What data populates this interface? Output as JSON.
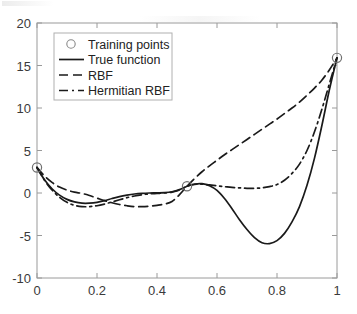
{
  "figure": {
    "background_color": "#ffffff",
    "axis_color": "#9a9a9a",
    "line_color": "#1a1a1a",
    "legend_border_color": "#b0b0b0",
    "legend_position": "upper-left"
  },
  "chart_data": {
    "type": "line",
    "title": "",
    "xlabel": "",
    "ylabel": "",
    "xlim": [
      0,
      1
    ],
    "ylim": [
      -10,
      20
    ],
    "grid": false,
    "xticks": [
      "0",
      "0.2",
      "0.4",
      "0.6",
      "0.8",
      "1"
    ],
    "xtick_values": [
      0,
      0.2,
      0.4,
      0.6,
      0.8,
      1
    ],
    "yticks": [
      "20",
      "15",
      "10",
      "5",
      "0",
      "-5",
      "-10"
    ],
    "ytick_values": [
      20,
      15,
      10,
      5,
      0,
      -5,
      -10
    ],
    "legend_position": "upper left",
    "legend": [
      "Training points",
      "True function",
      "RBF",
      "Hermitian RBF"
    ],
    "x": [
      0,
      0.025,
      0.05,
      0.075,
      0.1,
      0.125,
      0.15,
      0.175,
      0.2,
      0.225,
      0.25,
      0.275,
      0.3,
      0.325,
      0.35,
      0.375,
      0.4,
      0.425,
      0.45,
      0.475,
      0.5,
      0.525,
      0.55,
      0.575,
      0.6,
      0.625,
      0.65,
      0.675,
      0.7,
      0.725,
      0.75,
      0.775,
      0.8,
      0.825,
      0.85,
      0.875,
      0.9,
      0.925,
      0.95,
      0.975,
      1
    ],
    "series": [
      {
        "name": "True function",
        "style": "solid",
        "values": [
          3.0,
          1.55,
          0.5,
          -0.25,
          -0.75,
          -1.05,
          -1.2,
          -1.2,
          -1.1,
          -0.9,
          -0.65,
          -0.42,
          -0.25,
          -0.12,
          -0.04,
          0.0,
          0.02,
          0.05,
          0.15,
          0.4,
          0.8,
          1.05,
          1.1,
          0.85,
          0.3,
          -0.65,
          -1.85,
          -3.15,
          -4.3,
          -5.25,
          -5.85,
          -5.95,
          -5.6,
          -4.75,
          -3.4,
          -1.6,
          0.9,
          4.1,
          8.0,
          12.2,
          15.9
        ]
      },
      {
        "name": "RBF",
        "style": "dashed",
        "values": [
          3.0,
          2.0,
          1.25,
          0.7,
          0.35,
          0.1,
          -0.05,
          -0.3,
          -0.6,
          -0.9,
          -1.15,
          -1.35,
          -1.5,
          -1.6,
          -1.6,
          -1.55,
          -1.45,
          -1.3,
          -1.0,
          -0.2,
          0.8,
          1.7,
          2.5,
          3.2,
          3.85,
          4.5,
          5.1,
          5.7,
          6.3,
          6.9,
          7.5,
          8.1,
          8.7,
          9.35,
          10.0,
          10.7,
          11.5,
          12.35,
          13.3,
          14.5,
          15.9
        ]
      },
      {
        "name": "Hermitian RBF",
        "style": "dashdot",
        "values": [
          3.0,
          1.5,
          0.35,
          -0.5,
          -1.1,
          -1.45,
          -1.6,
          -1.6,
          -1.5,
          -1.3,
          -1.05,
          -0.8,
          -0.55,
          -0.35,
          -0.2,
          -0.1,
          -0.05,
          0.0,
          0.1,
          0.35,
          0.8,
          1.0,
          1.05,
          0.95,
          0.85,
          0.75,
          0.65,
          0.6,
          0.55,
          0.55,
          0.6,
          0.75,
          1.0,
          1.5,
          2.3,
          3.4,
          5.0,
          7.2,
          9.9,
          12.9,
          15.9
        ]
      }
    ],
    "training_points": [
      {
        "x": 0,
        "y": 3.0
      },
      {
        "x": 0.5,
        "y": 0.8
      },
      {
        "x": 1,
        "y": 15.9
      }
    ]
  }
}
